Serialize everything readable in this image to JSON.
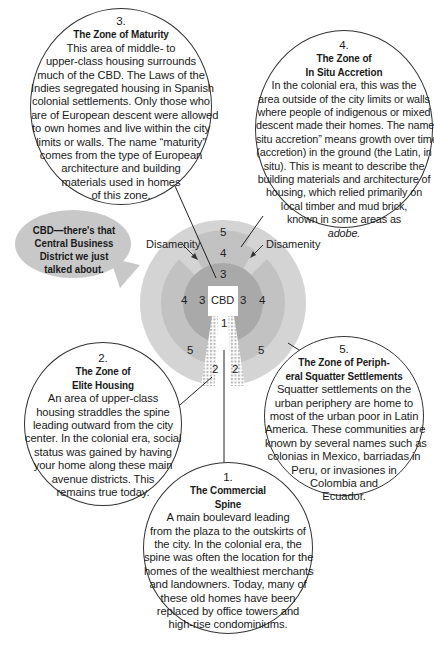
{
  "diagram": {
    "zones": {
      "center": "CBD",
      "spine": "1",
      "elite": "2",
      "maturity": "3",
      "in_situ": "4",
      "squatter": "5",
      "disamenity": "Disamenity"
    },
    "colors": {
      "zone5": "#d4d4d4",
      "zone4": "#c2c2c2",
      "zone3": "#a9a9a9",
      "cbd": "#ffffff",
      "bubble": "#c8c8c8"
    }
  },
  "bubble": {
    "lines": [
      "CBD—there's that",
      "Central Business",
      "District we just",
      "talked about."
    ]
  },
  "callouts": [
    {
      "id": "maturity",
      "number": "3.",
      "title": [
        "The Zone of Maturity"
      ],
      "body": [
        "This area of middle- to",
        "upper-class housing surrounds",
        "much of the CBD. The Laws of the",
        "Indies segregated housing in Spanish",
        "colonial settlements. Only those who",
        "are of European descent were allowed",
        "to own homes and live within the city",
        "limits or walls. The name “maturity”",
        "comes from the type of European",
        "architecture and building",
        "materials used in homes",
        "of this zone."
      ]
    },
    {
      "id": "in-situ",
      "number": "4.",
      "title": [
        "The Zone of",
        "In Situ Accretion"
      ],
      "body": [
        "In the colonial era, this was the",
        "area outside of the city limits or walls",
        "where people of indigenous or mixed",
        "descent made their homes. The name “in",
        "situ accretion” means growth over time",
        "(accretion) in the ground (the Latin, in",
        "situ). This is meant to describe the",
        "building materials and architecture of",
        "housing, which relied primarily on",
        "local timber and mud brick,",
        "known in some areas as",
        "adobe."
      ]
    },
    {
      "id": "elite",
      "number": "2.",
      "title": [
        "The Zone of",
        "Elite Housing"
      ],
      "body": [
        "An area of upper-class",
        "housing straddles the spine",
        "leading outward from the city",
        "center. In the colonial era, social",
        "status was gained by having",
        "your home along these main",
        "avenue districts. This",
        "remains true today."
      ]
    },
    {
      "id": "squatter",
      "number": "5.",
      "title": [
        "The Zone of Periph-",
        "eral Squatter Settlements"
      ],
      "body": [
        "Squatter settlements on the",
        "urban periphery are home to",
        "most of the urban poor in Latin",
        "America. These communities are",
        "known by several names such as",
        "colonias in Mexico, barriadas in",
        "Peru, or invasiones in",
        "Colombia and",
        "Ecuador."
      ]
    },
    {
      "id": "spine",
      "number": "1.",
      "title": [
        "The Commercial",
        "Spine"
      ],
      "body": [
        "A main boulevard leading",
        "from the plaza to the outskirts of",
        "the city. In the colonial era, the",
        "spine was often the location for the",
        "homes of the wealthiest merchants",
        "and landowners. Today, many of",
        "these old homes have been",
        "replaced by office towers and",
        "high-rise condominiums."
      ]
    }
  ]
}
